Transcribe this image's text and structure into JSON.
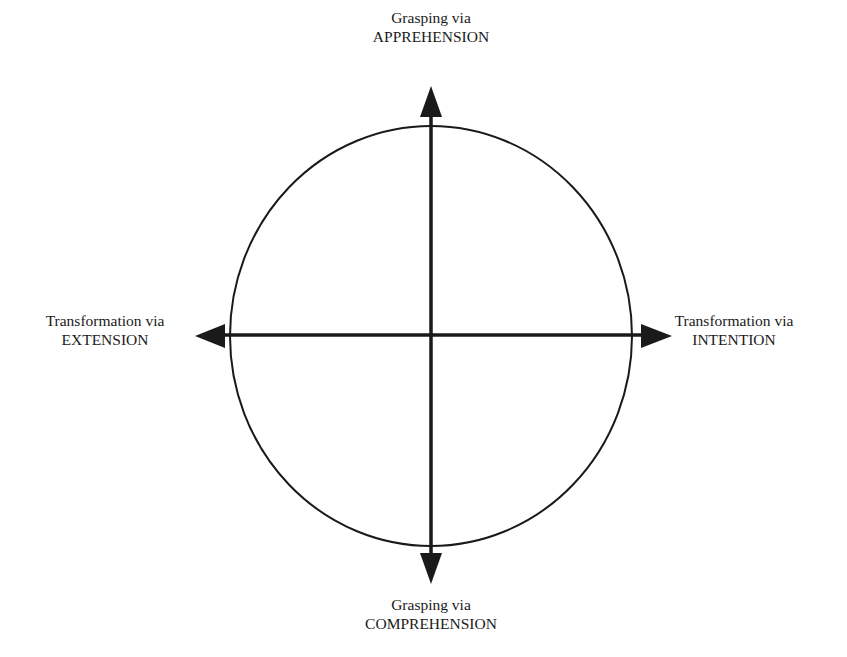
{
  "diagram": {
    "type": "circle-with-two-axes",
    "colors": {
      "stroke": "#1a1a1a",
      "background": "#ffffff"
    },
    "labels": {
      "top": {
        "line1": "Grasping via",
        "line2": "APPREHENSION"
      },
      "bottom": {
        "line1": "Grasping via",
        "line2": "COMPREHENSION"
      },
      "left": {
        "line1": "Transformation via",
        "line2": "EXTENSION"
      },
      "right": {
        "line1": "Transformation via",
        "line2": "INTENTION"
      }
    },
    "axes": [
      {
        "name": "vertical",
        "from": "COMPREHENSION",
        "to": "APPREHENSION",
        "arrows": "both"
      },
      {
        "name": "horizontal",
        "from": "EXTENSION",
        "to": "INTENTION",
        "arrows": "both"
      }
    ]
  }
}
